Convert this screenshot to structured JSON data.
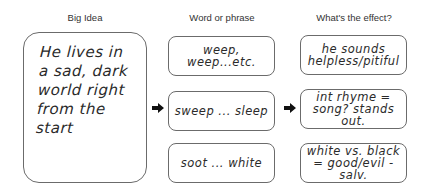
{
  "headers": {
    "big_idea": "Big Idea",
    "word_or_phrase": "Word or phrase",
    "effect": "What's the effect?"
  },
  "big_idea": {
    "text": "He lives in\na sad, dark\nworld right\nfrom the start"
  },
  "rows": [
    {
      "phrase": "weep, weep...etc.",
      "effect": "he sounds\nhelpless/pitiful"
    },
    {
      "phrase": "sweep ... sleep",
      "effect": "int rhyme =\nsong? stands out."
    },
    {
      "phrase": "soot ... white",
      "effect": "white vs. black\n= good/evil - salv."
    }
  ],
  "arrows": [
    {
      "icon": "arrow-right-icon",
      "from": "big_idea",
      "to": "rows.1.phrase"
    },
    {
      "icon": "arrow-right-icon",
      "from": "rows.1.phrase",
      "to": "rows.1.effect"
    }
  ],
  "colors": {
    "border": "#6b6b6b",
    "text": "#2a2a2a",
    "header": "#333333",
    "arrow": "#111111"
  }
}
